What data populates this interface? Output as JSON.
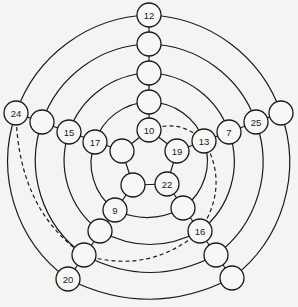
{
  "diagram": {
    "type": "graph",
    "node_radius": 12,
    "nodes": [
      {
        "id": "n12",
        "label": "12",
        "x": 149,
        "y": 15
      },
      {
        "id": "t3",
        "label": "",
        "x": 149,
        "y": 44
      },
      {
        "id": "t2",
        "label": "",
        "x": 149,
        "y": 73
      },
      {
        "id": "t1",
        "label": "",
        "x": 149,
        "y": 102
      },
      {
        "id": "n10",
        "label": "10",
        "x": 149,
        "y": 130
      },
      {
        "id": "n24",
        "label": "24",
        "x": 16,
        "y": 113
      },
      {
        "id": "l3",
        "label": "",
        "x": 42,
        "y": 122
      },
      {
        "id": "n15",
        "label": "15",
        "x": 69,
        "y": 132
      },
      {
        "id": "n17",
        "label": "17",
        "x": 95,
        "y": 142
      },
      {
        "id": "pl",
        "label": "",
        "x": 122,
        "y": 151
      },
      {
        "id": "r4",
        "label": "",
        "x": 281,
        "y": 113
      },
      {
        "id": "n25",
        "label": "25",
        "x": 256,
        "y": 122
      },
      {
        "id": "n7",
        "label": "7",
        "x": 229,
        "y": 132
      },
      {
        "id": "n13",
        "label": "13",
        "x": 204,
        "y": 141
      },
      {
        "id": "n19",
        "label": "19",
        "x": 177,
        "y": 151
      },
      {
        "id": "pbl",
        "label": "",
        "x": 133,
        "y": 185
      },
      {
        "id": "n22",
        "label": "22",
        "x": 167,
        "y": 184
      },
      {
        "id": "n9",
        "label": "9",
        "x": 115,
        "y": 210
      },
      {
        "id": "bl2",
        "label": "",
        "x": 100,
        "y": 231
      },
      {
        "id": "bl3",
        "label": "",
        "x": 84,
        "y": 255
      },
      {
        "id": "n20",
        "label": "20",
        "x": 68,
        "y": 279
      },
      {
        "id": "br1",
        "label": "",
        "x": 183,
        "y": 208
      },
      {
        "id": "n16",
        "label": "16",
        "x": 200,
        "y": 231
      },
      {
        "id": "br3",
        "label": "",
        "x": 216,
        "y": 255
      },
      {
        "id": "br4",
        "label": "",
        "x": 232,
        "y": 278
      }
    ],
    "solid_edges": [
      "M149,15 L149,130",
      "M16,113 L122,151",
      "M281,113 L177,151",
      "M133,185 L68,279",
      "M167,184 L232,278",
      "M149,130 L177,151 L167,184 L133,185 L122,151 Z",
      "M149,102 A58,58 0 0 1 204,141",
      "M149,102 A58,58 0 0 0 95,142",
      "M149,73 A87,87 0 0 1 229,132",
      "M149,73 A87,87 0 0 0 69,132",
      "M149,44 A116,116 0 0 1 256,122",
      "M149,44 A116,116 0 0 0 42,122",
      "M149,15 A145,145 0 0 1 281,113",
      "M149,15 A145,145 0 0 0 16,113",
      "M95,142 A58,58 0 0 0 115,210",
      "M69,132 A87,87 0 0 0 100,231",
      "M42,122 A116,116 0 0 0 84,255",
      "M16,113 A145,145 0 0 0 68,279",
      "M204,141 A58,58 0 0 1 183,208",
      "M229,132 A87,87 0 0 1 200,231",
      "M256,122 A116,116 0 0 1 216,255",
      "M281,113 A145,145 0 0 1 232,278",
      "M115,210 Q149,226 183,208",
      "M100,231 Q150,258 200,231",
      "M84,255 Q150,290 216,255",
      "M68,279 Q150,320 232,278"
    ],
    "dashed_edges": [
      "M149,130 Q180,118 204,141",
      "M204,141 Q230,185 200,231",
      "M16,113 Q18,210 84,255",
      "M84,255 Q150,275 200,231"
    ]
  }
}
